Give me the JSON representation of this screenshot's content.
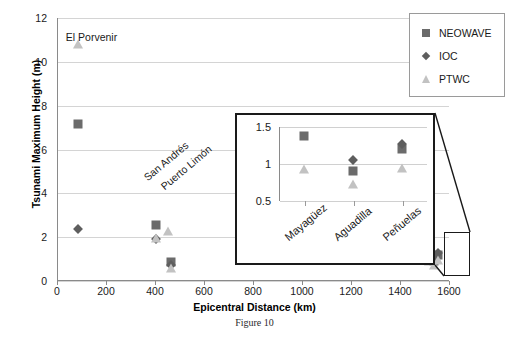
{
  "caption": "Figure 10",
  "legend": {
    "position": "top-right",
    "items": [
      {
        "label": "NEOWAVE",
        "marker": "square-icon",
        "color": "#6b6b6b"
      },
      {
        "label": "IOC",
        "marker": "diamond-icon",
        "color": "#5e5e5e"
      },
      {
        "label": "PTWC",
        "marker": "triangle-icon",
        "color": "#c2c2c2"
      }
    ]
  },
  "chart_data": {
    "type": "scatter",
    "title": "",
    "xlabel": "Epicentral Distance (km)",
    "ylabel": "Tsunami Maximum Height (m)",
    "xlim": [
      0,
      1600
    ],
    "ylim": [
      0,
      12
    ],
    "xticks": [
      0,
      200,
      400,
      600,
      800,
      1000,
      1200,
      1400,
      1600
    ],
    "yticks": [
      0,
      2,
      4,
      6,
      8,
      10,
      12
    ],
    "grid": "horizontal",
    "series": [
      {
        "name": "NEOWAVE",
        "marker": "square",
        "color": "#6b6b6b",
        "points": [
          {
            "x": 85,
            "y": 7.15,
            "site": "El Porvenir"
          },
          {
            "x": 405,
            "y": 2.55,
            "site": "San Andrés"
          },
          {
            "x": 465,
            "y": 0.88,
            "site": "Puerto Limón"
          },
          {
            "x": 1520,
            "y": 1.38,
            "site": "Mayagüez"
          },
          {
            "x": 1540,
            "y": 0.9,
            "site": "Aguadilla"
          },
          {
            "x": 1555,
            "y": 1.2,
            "site": "Peñuelas"
          }
        ]
      },
      {
        "name": "IOC",
        "marker": "diamond",
        "color": "#5e5e5e",
        "points": [
          {
            "x": 85,
            "y": 2.35,
            "site": "El Porvenir"
          },
          {
            "x": 405,
            "y": 1.9,
            "site": "San Andrés"
          },
          {
            "x": 465,
            "y": 0.72,
            "site": "Puerto Limón"
          },
          {
            "x": 1540,
            "y": 1.05,
            "site": "Aguadilla"
          },
          {
            "x": 1555,
            "y": 1.27,
            "site": "Peñuelas"
          }
        ]
      },
      {
        "name": "PTWC",
        "marker": "triangle",
        "color": "#c2c2c2",
        "points": [
          {
            "x": 85,
            "y": 10.8,
            "site": "El Porvenir"
          },
          {
            "x": 405,
            "y": 1.95,
            "site": "San Andrés"
          },
          {
            "x": 452,
            "y": 2.3,
            "site": "Puerto Limón"
          },
          {
            "x": 465,
            "y": 0.6,
            "site": "Puerto Limón"
          },
          {
            "x": 1520,
            "y": 0.93,
            "site": "Mayagüez"
          },
          {
            "x": 1540,
            "y": 0.73,
            "site": "Aguadilla"
          },
          {
            "x": 1555,
            "y": 0.95,
            "site": "Peñuelas"
          }
        ]
      }
    ],
    "annotations": [
      {
        "text": "El Porvenir",
        "x": 85,
        "y": 11.4,
        "rotated": false
      },
      {
        "text": "San Andrés",
        "x": 400,
        "y": 5.0,
        "rotated": true
      },
      {
        "text": "Puerto Limón",
        "x": 470,
        "y": 4.6,
        "rotated": true
      }
    ]
  },
  "inset": {
    "type": "scatter",
    "categories": [
      "Mayagüez",
      "Aguadilla",
      "Peñuelas"
    ],
    "yticks": [
      0.5,
      1,
      1.5
    ],
    "ylim": [
      0.5,
      1.5
    ],
    "grid": "horizontal",
    "series": [
      {
        "name": "NEOWAVE",
        "marker": "square",
        "color": "#6b6b6b",
        "values": [
          1.38,
          0.9,
          1.2
        ]
      },
      {
        "name": "IOC",
        "marker": "diamond",
        "color": "#5e5e5e",
        "values": [
          null,
          1.05,
          1.27
        ]
      },
      {
        "name": "PTWC",
        "marker": "triangle",
        "color": "#c2c2c2",
        "values": [
          0.93,
          0.73,
          0.95
        ]
      }
    ]
  }
}
